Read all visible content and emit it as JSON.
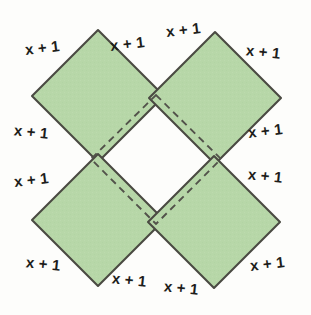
{
  "figure": {
    "shape_type": "geometric-diagram",
    "fill_color": "#b7d7a8",
    "stroke_color": "#4a4a42",
    "dashed_stroke_color": "#52524a",
    "background_color": "#fdfdfb",
    "edge_label_text": "x + 1",
    "edge_label_count": 12,
    "squares": [
      {
        "name": "top-left-square",
        "vertices": "98,30 164,96 98,162 32,96"
      },
      {
        "name": "top-right-square",
        "vertices": "215,32 281,98 215,164 149,98"
      },
      {
        "name": "bottom-left-square",
        "vertices": "98,154 164,220 98,286 32,220"
      },
      {
        "name": "bottom-right-square",
        "vertices": "214,156 280,222 214,288 148,222"
      }
    ],
    "inner_dashed_square": {
      "name": "inner-dashed-square",
      "vertices": "156,95 221,159 156,224 91,159"
    },
    "labels": [
      {
        "id": "label-tl-upper-left",
        "text": "x + 1",
        "x": 25,
        "y": 40,
        "tilt": "tilt-neg"
      },
      {
        "id": "label-tl-upper-right",
        "text": "x + 1",
        "x": 110,
        "y": 36,
        "tilt": "tilt-neg"
      },
      {
        "id": "label-tr-upper-left",
        "text": "x + 1",
        "x": 166,
        "y": 22,
        "tilt": "tilt-neg"
      },
      {
        "id": "label-tr-upper-right",
        "text": "x + 1",
        "x": 246,
        "y": 44,
        "tilt": "tilt-pos"
      },
      {
        "id": "label-tl-lower-left",
        "text": "x + 1",
        "x": 14,
        "y": 124,
        "tilt": "tilt-pos"
      },
      {
        "id": "label-tr-lower-right",
        "text": "x + 1",
        "x": 248,
        "y": 123,
        "tilt": "tilt-neg"
      },
      {
        "id": "label-bl-upper-left",
        "text": "x + 1",
        "x": 14,
        "y": 172,
        "tilt": "tilt-neg"
      },
      {
        "id": "label-br-upper-right",
        "text": "x + 1",
        "x": 248,
        "y": 168,
        "tilt": "tilt-pos"
      },
      {
        "id": "label-bl-lower-left",
        "text": "x + 1",
        "x": 26,
        "y": 256,
        "tilt": "tilt-pos"
      },
      {
        "id": "label-bl-lower-right",
        "text": "x + 1",
        "x": 112,
        "y": 272,
        "tilt": "tilt-pos"
      },
      {
        "id": "label-br-lower-left",
        "text": "x + 1",
        "x": 164,
        "y": 280,
        "tilt": "tilt-pos"
      },
      {
        "id": "label-br-lower-right",
        "text": "x + 1",
        "x": 250,
        "y": 256,
        "tilt": "tilt-neg"
      }
    ]
  }
}
